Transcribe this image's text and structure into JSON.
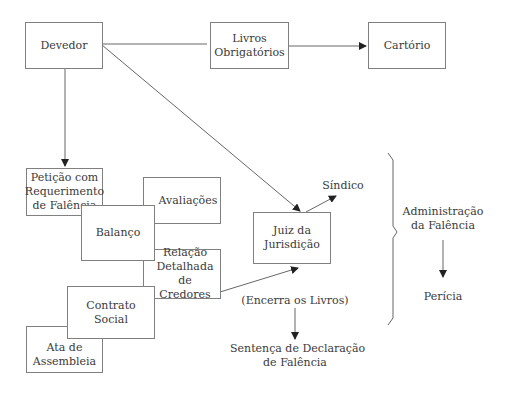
{
  "diagram": {
    "nodes": {
      "devedor": "Devedor",
      "livros": "Livros Obrigatórios",
      "cartorio": "Cartório",
      "peticao": "Petição com Requerimento de Falência",
      "avaliacoes": "Avaliações",
      "balanco": "Balanço",
      "relacao": "Relação Detalhada de Credores",
      "contrato": "Contrato Social",
      "ata": "Ata de Assembleia",
      "juiz": "Juiz da Jurisdição"
    },
    "labels": {
      "sindico": "Síndico",
      "encerra": "(Encerra os Livros)",
      "sentenca_1": "Sentença de Declaração",
      "sentenca_2": "de Falência",
      "administracao_1": "Administração",
      "administracao_2": "da Falência",
      "pericia": "Perícia"
    },
    "edges": [
      {
        "from": "Devedor",
        "to": "Livros Obrigatórios",
        "arrow": false
      },
      {
        "from": "Livros Obrigatórios",
        "to": "Cartório",
        "arrow": true
      },
      {
        "from": "Devedor",
        "to": "Petição com Requerimento de Falência",
        "arrow": true
      },
      {
        "from": "Devedor",
        "to": "Juiz da Jurisdição",
        "arrow": true
      },
      {
        "from": "Relação Detalhada de Credores",
        "to": "Juiz da Jurisdição",
        "arrow": true
      },
      {
        "from": "Juiz da Jurisdição",
        "to": "Síndico",
        "arrow": true
      },
      {
        "from": "(Encerra os Livros)",
        "to": "Sentença de Declaração de Falência",
        "arrow": true
      },
      {
        "from": "Administração da Falência",
        "to": "Perícia",
        "arrow": true
      }
    ],
    "colors": {
      "line": "#555555",
      "border": "#808080",
      "text": "#3a3a3a"
    }
  }
}
